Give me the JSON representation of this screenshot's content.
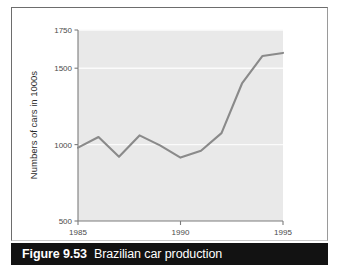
{
  "figure": {
    "caption_number": "Figure 9.53",
    "caption_title": "Brazilian car production"
  },
  "colors": {
    "plot_background": "#e9e9e9",
    "line": "#8a8a8a",
    "gridline": "#fbfbfb",
    "axis": "#7c7c7c",
    "tick_label": "#4a4a4a",
    "caption_bar": "#121212",
    "caption_text": "#ffffff",
    "page_background": "#ffffff",
    "frame_border": "#6d6d6d"
  },
  "chart_data": {
    "type": "line",
    "title": "",
    "xlabel": "",
    "ylabel": "Numbers of cars in 1000s",
    "x": [
      1985,
      1986,
      1987,
      1988,
      1989,
      1990,
      1991,
      1992,
      1993,
      1994,
      1995
    ],
    "values": [
      980,
      1050,
      920,
      1060,
      995,
      915,
      960,
      1075,
      1400,
      1580,
      1600
    ],
    "xlim": [
      1985,
      1995
    ],
    "ylim": [
      500,
      1750
    ],
    "xticks": [
      1985,
      1990,
      1995
    ],
    "xtick_labels": [
      "1985",
      "1990",
      "1995"
    ],
    "yticks": [
      500,
      1000,
      1500,
      1750
    ],
    "ytick_labels": [
      "500",
      "1000",
      "1500",
      "1750"
    ],
    "gridlines": "horizontal",
    "legend": "none",
    "series": [
      {
        "name": "Brazilian car production",
        "values": [
          980,
          1050,
          920,
          1060,
          995,
          915,
          960,
          1075,
          1400,
          1580,
          1600
        ]
      }
    ]
  }
}
